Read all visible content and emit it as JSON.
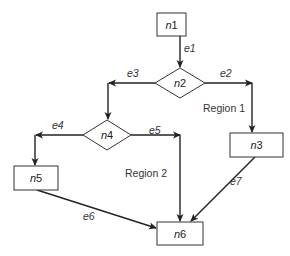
{
  "diagram": {
    "type": "control-flow-graph",
    "nodes": [
      {
        "id": "n1",
        "prefix": "n",
        "index": "1",
        "shape": "rectangle"
      },
      {
        "id": "n2",
        "prefix": "n",
        "index": "2",
        "shape": "diamond"
      },
      {
        "id": "n3",
        "prefix": "n",
        "index": "3",
        "shape": "rectangle"
      },
      {
        "id": "n4",
        "prefix": "n",
        "index": "4",
        "shape": "diamond"
      },
      {
        "id": "n5",
        "prefix": "n",
        "index": "5",
        "shape": "rectangle"
      },
      {
        "id": "n6",
        "prefix": "n",
        "index": "6",
        "shape": "rectangle"
      }
    ],
    "edges": [
      {
        "label": "e1",
        "from": "n1",
        "to": "n2"
      },
      {
        "label": "e2",
        "from": "n2",
        "to": "n3"
      },
      {
        "label": "e3",
        "from": "n2",
        "to": "n4"
      },
      {
        "label": "e4",
        "from": "n4",
        "to": "n5"
      },
      {
        "label": "e5",
        "from": "n4",
        "to": "n6"
      },
      {
        "label": "e6",
        "from": "n5",
        "to": "n6"
      },
      {
        "label": "e7",
        "from": "n3",
        "to": "n6"
      }
    ],
    "regions": [
      {
        "label": "Region 1"
      },
      {
        "label": "Region 2"
      }
    ]
  }
}
